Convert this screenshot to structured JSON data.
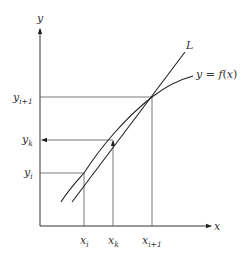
{
  "diagram": {
    "type": "secant-line-interpolation",
    "axes": {
      "x_label": "x",
      "y_label": "y"
    },
    "curve": {
      "name": "f",
      "label_prefix": "y = ",
      "label_func": "f",
      "label_arg": "(x)"
    },
    "line": {
      "label": "L"
    },
    "x_ticks": [
      {
        "base": "x",
        "sub": "i"
      },
      {
        "base": "x",
        "sub": "k"
      },
      {
        "base": "x",
        "sub": "i+1"
      }
    ],
    "y_ticks": [
      {
        "base": "y",
        "sub": "i+1"
      },
      {
        "base": "y",
        "sub": "k"
      },
      {
        "base": "y",
        "sub": "i"
      }
    ],
    "colors": {
      "stroke": "#333333",
      "background": "#ffffff"
    }
  }
}
